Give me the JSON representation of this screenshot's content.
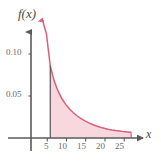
{
  "figure": {
    "background_color": "#ffffff",
    "axis_color": "#5a5a5a",
    "curve_color": "#d9607a",
    "fill_color": "#f9d7de",
    "tick_label_color": "#6a6a6a",
    "axis_name_color": "#4a4a4a"
  },
  "labels": {
    "y_axis_name": "f(x)",
    "x_axis_name": "x",
    "y_ticks": [
      "0.10",
      "0.05"
    ],
    "x_ticks": [
      "5",
      "10",
      "15",
      "20",
      "25"
    ]
  },
  "chart_data": {
    "type": "area",
    "title": "",
    "subtitle": "",
    "xlabel": "x",
    "ylabel": "f(x)",
    "xlim": [
      0,
      29
    ],
    "ylim": [
      0,
      0.145
    ],
    "grid": false,
    "legend": null,
    "legend_position": "none",
    "x_tick_values": [
      5,
      10,
      15,
      20,
      25
    ],
    "x_tick_labels": [
      "5",
      "10",
      "15",
      "20",
      "25"
    ],
    "y_tick_values": [
      0.05,
      0.1
    ],
    "y_tick_labels": [
      "0.05",
      "0.10"
    ],
    "series": [
      {
        "name": "f(x)",
        "description": "exponential decay curve f(x) = 0.2*exp(-x/12)",
        "x": [
          3.0,
          4.0,
          5.0,
          6.0,
          7.0,
          8.0,
          9.0,
          10.0,
          11.0,
          12.0,
          13.0,
          14.0,
          15.0,
          16.0,
          17.0,
          18.0,
          19.0,
          20.0,
          21.0,
          22.0,
          23.0,
          24.0,
          25.0,
          26.0
        ],
        "y": [
          0.1402,
          0.124,
          0.086,
          0.068,
          0.056,
          0.047,
          0.04,
          0.0345,
          0.03,
          0.0262,
          0.023,
          0.0203,
          0.018,
          0.016,
          0.0143,
          0.0128,
          0.0116,
          0.0105,
          0.0096,
          0.0088,
          0.0082,
          0.0076,
          0.0072,
          0.0069
        ]
      }
    ],
    "shaded_region": {
      "label": "",
      "x_start": 5,
      "x_end": 26,
      "y_lower": 0,
      "fill_color": "#f9d7de"
    },
    "annotations": [
      {
        "text": "f(x)",
        "kind": "axis-name",
        "position": "top-left"
      },
      {
        "text": "x",
        "kind": "axis-name",
        "position": "right-of-x-axis"
      }
    ]
  }
}
